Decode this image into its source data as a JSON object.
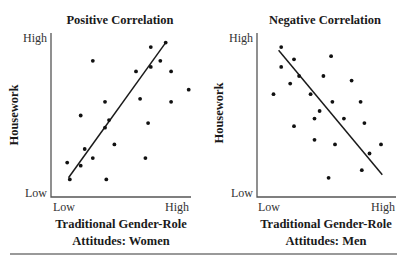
{
  "chart_data": [
    {
      "type": "scatter",
      "title": "Positive Correlation",
      "xlabel": "Traditional Gender-Role Attitudes: Women",
      "xlabel_lines": [
        "Traditional Gender-Role",
        "Attitudes: Women"
      ],
      "ylabel": "Housework",
      "x_ticks": [
        "Low",
        "High"
      ],
      "y_ticks": [
        "Low",
        "High"
      ],
      "xlim": [
        0,
        100
      ],
      "ylim": [
        0,
        100
      ],
      "grid": false,
      "trendline": {
        "direction": "positive",
        "from": [
          10,
          8
        ],
        "to": [
          82,
          97
        ]
      },
      "points": [
        [
          82,
          97
        ],
        [
          71,
          94
        ],
        [
          28,
          85
        ],
        [
          78,
          85
        ],
        [
          71,
          81
        ],
        [
          60,
          78
        ],
        [
          86,
          78
        ],
        [
          99,
          66
        ],
        [
          37,
          58
        ],
        [
          63,
          60
        ],
        [
          86,
          58
        ],
        [
          19,
          49
        ],
        [
          40,
          46
        ],
        [
          69,
          44
        ],
        [
          37,
          41
        ],
        [
          44,
          30
        ],
        [
          22,
          27
        ],
        [
          28,
          21
        ],
        [
          67,
          21
        ],
        [
          9,
          18
        ],
        [
          19,
          16
        ],
        [
          11,
          7
        ],
        [
          38,
          7
        ]
      ]
    },
    {
      "type": "scatter",
      "title": "Negative Correlation",
      "xlabel": "Traditional Gender-Role Attitudes: Men",
      "xlabel_lines": [
        "Traditional Gender-Role",
        "Attitudes: Men"
      ],
      "ylabel": "Housework",
      "x_ticks": [
        "Low",
        "High"
      ],
      "y_ticks": [
        "Low",
        "High"
      ],
      "xlim": [
        0,
        100
      ],
      "ylim": [
        0,
        100
      ],
      "grid": false,
      "trendline": {
        "direction": "negative",
        "from": [
          13,
          92
        ],
        "to": [
          94,
          10
        ]
      },
      "points": [
        [
          15,
          94
        ],
        [
          54,
          88
        ],
        [
          25,
          86
        ],
        [
          15,
          81
        ],
        [
          29,
          75
        ],
        [
          48,
          75
        ],
        [
          70,
          72
        ],
        [
          22,
          70
        ],
        [
          9,
          63
        ],
        [
          38,
          63
        ],
        [
          55,
          58
        ],
        [
          77,
          58
        ],
        [
          45,
          52
        ],
        [
          41,
          47
        ],
        [
          64,
          47
        ],
        [
          80,
          44
        ],
        [
          25,
          42
        ],
        [
          41,
          33
        ],
        [
          57,
          30
        ],
        [
          93,
          30
        ],
        [
          84,
          24
        ],
        [
          78,
          13
        ],
        [
          52,
          8
        ]
      ]
    }
  ],
  "panels": [
    {
      "title": "Positive Correlation",
      "ylabel": "Housework",
      "y_high": "High",
      "y_low": "Low",
      "x_low": "Low",
      "x_high": "High",
      "xlabel_line1": "Traditional Gender-Role",
      "xlabel_line2": "Attitudes: Women"
    },
    {
      "title": "Negative Correlation",
      "ylabel": "Housework",
      "y_high": "High",
      "y_low": "Low",
      "x_low": "Low",
      "x_high": "High",
      "xlabel_line1": "Traditional Gender-Role",
      "xlabel_line2": "Attitudes: Men"
    }
  ],
  "colors": {
    "points": "#111111",
    "axes": "#555555",
    "text": "#1a1a1a"
  }
}
